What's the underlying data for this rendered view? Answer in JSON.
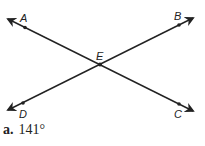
{
  "diagram": {
    "lines": [
      {
        "name": "line-AC",
        "from": [
          8,
          19
        ],
        "to": [
          193,
          111
        ]
      },
      {
        "name": "line-DB",
        "from": [
          8,
          110
        ],
        "to": [
          193,
          18
        ]
      }
    ],
    "points": {
      "A": {
        "label": "A",
        "x": 25,
        "y": 27
      },
      "B": {
        "label": "B",
        "x": 179,
        "y": 25
      },
      "C": {
        "label": "C",
        "x": 179,
        "y": 104
      },
      "D": {
        "label": "D",
        "x": 23,
        "y": 103
      },
      "E": {
        "label": "E",
        "x": 100,
        "y": 64
      }
    },
    "stroke_color": "#222222"
  },
  "answer": {
    "letter": "a.",
    "value": "141°"
  }
}
